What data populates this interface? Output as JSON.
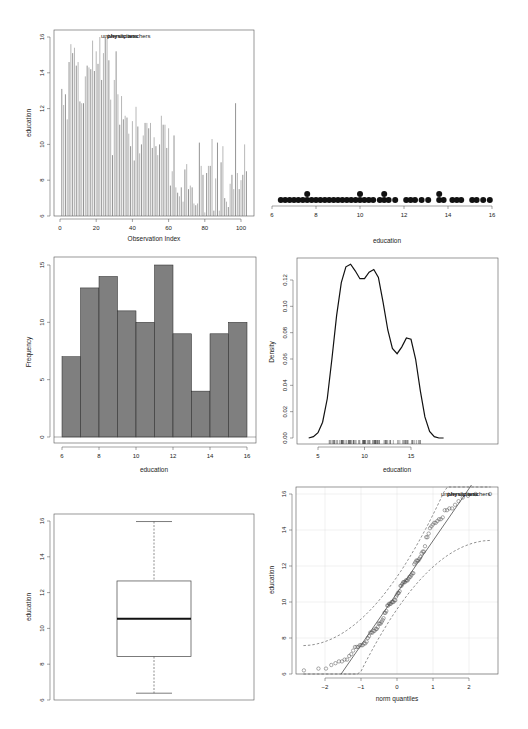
{
  "chart_data": [
    {
      "id": "index_plot",
      "type": "bar",
      "title": "",
      "xlabel": "Observation Index",
      "ylabel": "education",
      "xlim": [
        0,
        103
      ],
      "ylim": [
        6,
        16
      ],
      "xticks": [
        0,
        20,
        40,
        60,
        80,
        100
      ],
      "yticks": [
        6,
        8,
        10,
        12,
        14,
        16
      ],
      "annotations": [
        "university.teachers",
        "physicians"
      ],
      "values": [
        13.1,
        12.2,
        12.8,
        11.4,
        14.6,
        15.6,
        15.1,
        15.4,
        14.4,
        14.6,
        12.4,
        12.3,
        12.3,
        13.8,
        14.4,
        14.3,
        14.2,
        15.8,
        14.1,
        15.2,
        14.5,
        16.0,
        13.6,
        15.1,
        16.0,
        15.9,
        14.7,
        12.5,
        9.4,
        13.6,
        15.2,
        12.8,
        11.1,
        12.7,
        11.4,
        11.6,
        11.5,
        10.6,
        9.9,
        11.3,
        9.1,
        12.1,
        11.0,
        9.5,
        10.0,
        10.5,
        11.2,
        11.2,
        10.9,
        11.2,
        9.8,
        10.4,
        9.9,
        9.4,
        10.0,
        11.6,
        11.1,
        11.1,
        9.8,
        10.9,
        7.7,
        8.5,
        10.5,
        7.6,
        7.3,
        7.1,
        7.6,
        6.8,
        8.6,
        8.9,
        7.5,
        7.7,
        7.6,
        6.7,
        6.6,
        6.7,
        10.1,
        8.8,
        8.3,
        6.2,
        8.4,
        8.8,
        8.8,
        10.3,
        6.3,
        8.1,
        10.1,
        6.3,
        9.0,
        9.9,
        7.0,
        6.8,
        6.5,
        7.8,
        8.3,
        7.5,
        12.3,
        8.4,
        7.5,
        8.0,
        8.3,
        10.0,
        8.5
      ],
      "grid": false
    },
    {
      "id": "dot_plot",
      "type": "scatter",
      "xlabel": "education",
      "ylabel": "",
      "xlim": [
        6,
        16
      ],
      "xticks": [
        6,
        8,
        10,
        12,
        14,
        16
      ],
      "points": [
        {
          "x": 6.4,
          "stack": 1
        },
        {
          "x": 6.6,
          "stack": 1
        },
        {
          "x": 6.8,
          "stack": 1
        },
        {
          "x": 7.0,
          "stack": 1
        },
        {
          "x": 7.2,
          "stack": 1
        },
        {
          "x": 7.4,
          "stack": 1
        },
        {
          "x": 7.6,
          "stack": 2
        },
        {
          "x": 7.8,
          "stack": 1
        },
        {
          "x": 8.0,
          "stack": 1
        },
        {
          "x": 8.2,
          "stack": 1
        },
        {
          "x": 8.4,
          "stack": 1
        },
        {
          "x": 8.6,
          "stack": 1
        },
        {
          "x": 8.8,
          "stack": 1
        },
        {
          "x": 9.0,
          "stack": 1
        },
        {
          "x": 9.2,
          "stack": 1
        },
        {
          "x": 9.4,
          "stack": 1
        },
        {
          "x": 9.6,
          "stack": 1
        },
        {
          "x": 9.8,
          "stack": 1
        },
        {
          "x": 10.0,
          "stack": 2
        },
        {
          "x": 10.2,
          "stack": 1
        },
        {
          "x": 10.4,
          "stack": 1
        },
        {
          "x": 10.6,
          "stack": 1
        },
        {
          "x": 10.9,
          "stack": 1
        },
        {
          "x": 11.1,
          "stack": 2
        },
        {
          "x": 11.3,
          "stack": 1
        },
        {
          "x": 11.6,
          "stack": 1
        },
        {
          "x": 12.1,
          "stack": 1
        },
        {
          "x": 12.3,
          "stack": 1
        },
        {
          "x": 12.5,
          "stack": 1
        },
        {
          "x": 12.8,
          "stack": 1
        },
        {
          "x": 13.1,
          "stack": 1
        },
        {
          "x": 13.6,
          "stack": 2
        },
        {
          "x": 13.8,
          "stack": 1
        },
        {
          "x": 14.2,
          "stack": 1
        },
        {
          "x": 14.4,
          "stack": 1
        },
        {
          "x": 14.6,
          "stack": 1
        },
        {
          "x": 15.1,
          "stack": 1
        },
        {
          "x": 15.3,
          "stack": 1
        },
        {
          "x": 15.6,
          "stack": 1
        },
        {
          "x": 15.9,
          "stack": 1
        }
      ]
    },
    {
      "id": "histogram",
      "type": "bar",
      "xlabel": "education",
      "ylabel": "Frequency",
      "xlim": [
        6,
        16
      ],
      "ylim": [
        0,
        15
      ],
      "xticks": [
        6,
        8,
        10,
        12,
        14,
        16
      ],
      "yticks": [
        0,
        5,
        10,
        15
      ],
      "categories": [
        "6-7",
        "7-8",
        "8-9",
        "9-10",
        "10-11",
        "11-12",
        "12-13",
        "13-14",
        "14-15",
        "15-16"
      ],
      "values": [
        7,
        13,
        14,
        11,
        10,
        15,
        9,
        4,
        9,
        10
      ],
      "bar_color": "#7f7f7f"
    },
    {
      "id": "density",
      "type": "line",
      "xlabel": "education",
      "ylabel": "Density",
      "xlim": [
        3.5,
        18.7
      ],
      "ylim": [
        0,
        0.132
      ],
      "xticks": [
        5,
        10,
        15
      ],
      "yticks": [
        0.0,
        0.02,
        0.04,
        0.06,
        0.08,
        0.1,
        0.12
      ],
      "ytick_labels": [
        "0.00",
        "0.02",
        "0.04",
        "0.06",
        "0.08",
        "0.10",
        "0.12"
      ],
      "x": [
        4.0,
        4.5,
        5.0,
        5.5,
        6.0,
        6.5,
        7.0,
        7.5,
        8.0,
        8.5,
        9.0,
        9.5,
        10.0,
        10.5,
        11.0,
        11.5,
        12.0,
        12.5,
        13.0,
        13.5,
        14.0,
        14.5,
        15.0,
        15.5,
        16.0,
        16.5,
        17.0,
        17.5,
        18.0,
        18.5
      ],
      "y": [
        0.0,
        0.001,
        0.004,
        0.012,
        0.03,
        0.06,
        0.093,
        0.118,
        0.13,
        0.132,
        0.127,
        0.121,
        0.121,
        0.126,
        0.128,
        0.122,
        0.103,
        0.082,
        0.068,
        0.064,
        0.069,
        0.076,
        0.075,
        0.06,
        0.036,
        0.016,
        0.005,
        0.001,
        0.0,
        0.0
      ],
      "rug": true
    },
    {
      "id": "boxplot",
      "type": "box",
      "xlabel": "",
      "ylabel": "education",
      "ylim": [
        6,
        16
      ],
      "yticks": [
        6,
        8,
        10,
        12,
        14,
        16
      ],
      "stats": {
        "min": 6.38,
        "q1": 8.43,
        "median": 10.54,
        "q3": 12.65,
        "max": 15.97
      }
    },
    {
      "id": "qq_plot",
      "type": "scatter",
      "xlabel": "norm quantiles",
      "ylabel": "education",
      "xlim": [
        -2.7,
        2.7
      ],
      "ylim": [
        6,
        16
      ],
      "xticks": [
        -2,
        -1,
        0,
        1,
        2
      ],
      "yticks": [
        6,
        8,
        10,
        12,
        14,
        16
      ],
      "grid": true,
      "reference_line": {
        "intercept": 10.5,
        "slope": 2.9
      },
      "envelope": "dashed",
      "annotations": [
        "university.teachers",
        "physicians"
      ]
    }
  ],
  "labels": {
    "p1_xlabel": "Observation Index",
    "p1_ylabel": "education",
    "p1_annot": "university.teachers",
    "p1_annot2": "physicians",
    "p2_xlabel": "education",
    "p3_xlabel": "education",
    "p3_ylabel": "Frequency",
    "p4_xlabel": "education",
    "p4_ylabel": "Density",
    "p5_ylabel": "education",
    "p6_xlabel": "norm quantiles",
    "p6_ylabel": "education",
    "p6_annot": "university.teachers",
    "p6_annot2": "physicians"
  }
}
